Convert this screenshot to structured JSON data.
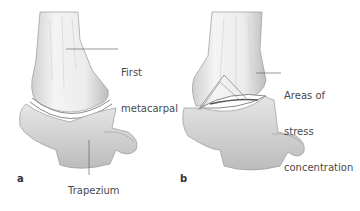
{
  "figure": {
    "panels": [
      {
        "id": "a",
        "letter": "a",
        "labels": {
          "metacarpal_line1": "First",
          "metacarpal_line2": "metacarpal",
          "trapezium": "Trapezium"
        }
      },
      {
        "id": "b",
        "letter": "b",
        "labels": {
          "stress_line1": "Areas of",
          "stress_line2": "stress",
          "stress_line3": "concentration"
        }
      }
    ],
    "colors": {
      "bone_light": "#f2f2f2",
      "bone_mid": "#d9d9d9",
      "bone_shadow": "#a8a8a8",
      "outline": "#9a9a9a",
      "leader": "#555555",
      "text": "#4a4a4a"
    }
  }
}
